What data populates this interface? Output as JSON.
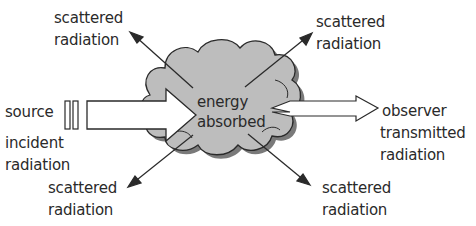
{
  "diagram": {
    "source_label": "source",
    "incident_label_1": "incident",
    "incident_label_2": "radiation",
    "center_label_1": "energy",
    "center_label_2": "absorbed",
    "observer_label": "observer",
    "transmitted_label_1": "transmitted",
    "transmitted_label_2": "radiation",
    "scatter_top_left_1": "scattered",
    "scatter_top_left_2": "radiation",
    "scatter_top_right_1": "scattered",
    "scatter_top_right_2": "radiation",
    "scatter_bottom_left_1": "scattered",
    "scatter_bottom_left_2": "radiation",
    "scatter_bottom_right_1": "scattered",
    "scatter_bottom_right_2": "radiation",
    "colors": {
      "cloud_fill": "#bdbdbd",
      "cloud_shadow": "#6e6e6e",
      "stroke": "#2a2a2a",
      "arrow_fill": "#ffffff"
    }
  }
}
